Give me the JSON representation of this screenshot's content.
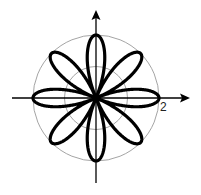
{
  "chart_data": {
    "type": "line",
    "subtype": "polar",
    "title": "",
    "equation": "r = 2cos(4θ)",
    "petals": 8,
    "amplitude": 2,
    "k": 4,
    "xlabel": "",
    "ylabel": "",
    "reference_circles": [
      1,
      2
    ],
    "tick_labels": [
      {
        "text": "2",
        "r": 2,
        "angle_deg": 0
      }
    ],
    "rlim": [
      0,
      2
    ],
    "grid": true,
    "legend": null,
    "colors": {
      "curve": "#000000",
      "axes": "#000000",
      "grid": "#9a9a9a"
    }
  },
  "layout": {
    "center": [
      96,
      98
    ],
    "unit_px": 31.5,
    "x_axis": {
      "from": 12,
      "to": 190
    },
    "y_axis": {
      "from": 183,
      "to": 10
    }
  }
}
